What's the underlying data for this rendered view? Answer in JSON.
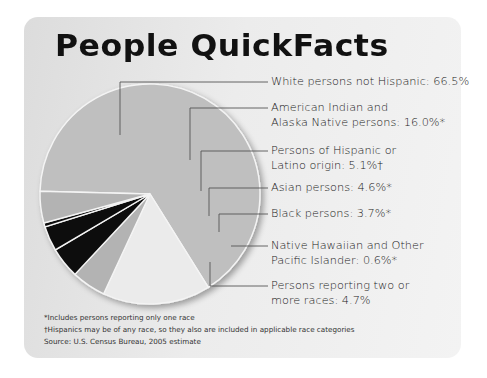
{
  "chart_data": {
    "type": "pie",
    "title": "People QuickFacts",
    "slices": [
      {
        "label": "White persons not Hispanic",
        "value": 66.5,
        "display": "White persons not Hispanic: 66.5%",
        "color": "#bfbfbf"
      },
      {
        "label": "American Indian and Alaska Native persons",
        "value": 16.0,
        "display_line1": "American Indian and",
        "display_line2": "Alaska Native persons: 16.0%*",
        "color": "#ebebeb"
      },
      {
        "label": "Persons of Hispanic or Latino origin",
        "value": 5.1,
        "display_line1": "Persons of Hispanic or",
        "display_line2": "Latino origin: 5.1%†",
        "color": "#b3b3b3"
      },
      {
        "label": "Asian persons",
        "value": 4.6,
        "display": "Asian persons: 4.6%*",
        "color": "#111111"
      },
      {
        "label": "Black persons",
        "value": 3.7,
        "display": "Black persons: 3.7%*",
        "color": "#111111"
      },
      {
        "label": "Native Hawaiian and Other Pacific Islander",
        "value": 0.6,
        "display_line1": "Native Hawaiian and Other",
        "display_line2": "Pacific Islander: 0.6%*",
        "color": "#111111"
      },
      {
        "label": "Persons reporting two or more races",
        "value": 4.7,
        "display_line1": "Persons reporting two or",
        "display_line2": "more races: 4.7%",
        "color": "#b3b3b3"
      }
    ],
    "legend_position": "right",
    "notes": [
      "*Includes persons reporting only one race",
      "†Hispanics may be of any race, so they also are included in applicable race categories",
      "Source: U.S. Census Bureau, 2005 estimate"
    ]
  },
  "header": {
    "title": "People QuickFacts"
  },
  "labels": {
    "white": "White persons not Hispanic: 66.5%",
    "aian_1": "American Indian and",
    "aian_2": "Alaska Native persons: 16.0%*",
    "hisp_1": "Persons of Hispanic or",
    "hisp_2": "Latino origin: 5.1%†",
    "asian": "Asian persons: 4.6%*",
    "black": "Black persons: 3.7%*",
    "nhpi_1": "Native Hawaiian and Other",
    "nhpi_2": "Pacific Islander: 0.6%*",
    "two_1": "Persons reporting two or",
    "two_2": "more races: 4.7%"
  },
  "footnotes": {
    "note1": "*Includes persons reporting only one race",
    "note2": "†Hispanics may be of any race, so they also are included in applicable race categories",
    "source": "Source: U.S. Census Bureau, 2005 estimate"
  }
}
